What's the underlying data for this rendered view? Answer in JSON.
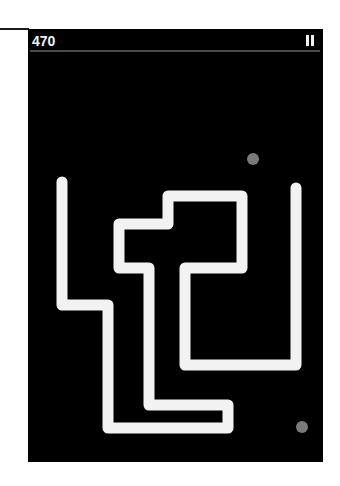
{
  "hud": {
    "score": "470",
    "pause_icon": "pause-icon"
  },
  "colors": {
    "background": "#000000",
    "snake": "#f2f2f2",
    "food": "#7a7a7a",
    "divider": "#4a4a4a"
  },
  "snake": {
    "stroke_width": 11,
    "points": "34,153 34,276 80,276 80,399 200,399 200,376 121,376 121,239 91,239 91,195 140,195 140,167 214,167 214,239 157,239 157,336 268,336 268,159"
  },
  "food": [
    {
      "cx": 225,
      "cy": 130,
      "r": 6
    },
    {
      "cx": 274,
      "cy": 398,
      "r": 6
    }
  ]
}
